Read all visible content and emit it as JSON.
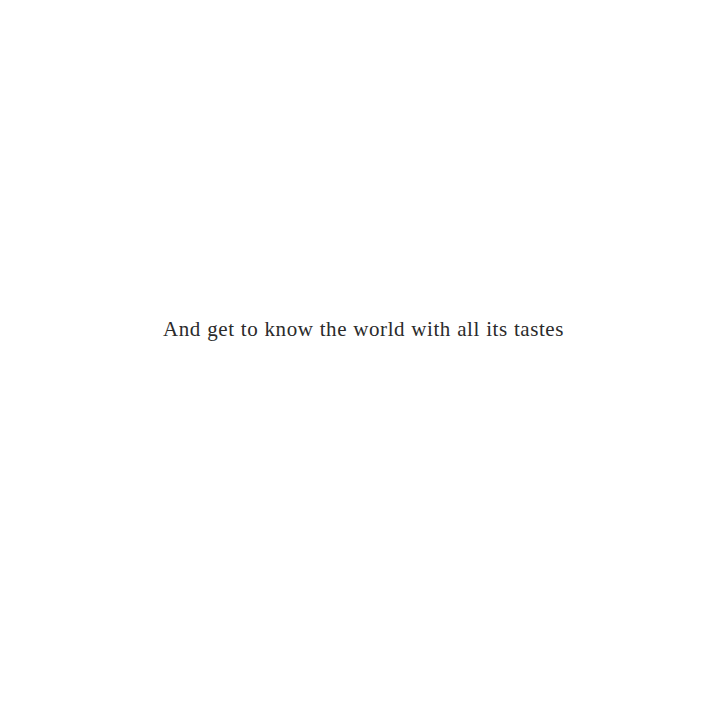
{
  "page": {
    "background_color": "#ffffff",
    "text_color": "#2b2b2b"
  },
  "content": {
    "tagline": "And get to know the world with all its tastes"
  }
}
